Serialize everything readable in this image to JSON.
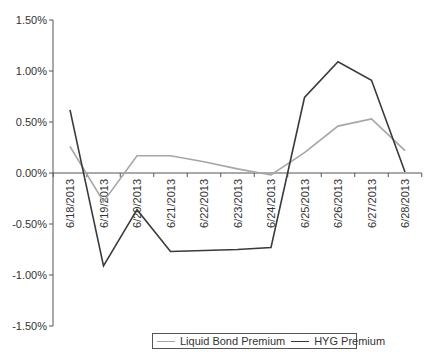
{
  "chart_data": {
    "type": "line",
    "title": "",
    "xlabel": "",
    "ylabel": "",
    "categories": [
      "6/18/2013",
      "6/19/2013",
      "6/20/2013",
      "6/21/2013",
      "6/22/2013",
      "6/23/2013",
      "6/24/2013",
      "6/25/2013",
      "6/26/2013",
      "6/27/2013",
      "6/28/2013"
    ],
    "series": [
      {
        "name": "Liquid Bond Premium",
        "color": "#a6a6a6",
        "values": [
          0.26,
          -0.28,
          0.17,
          0.17,
          0.11,
          0.04,
          -0.02,
          0.2,
          0.46,
          0.53,
          0.22
        ]
      },
      {
        "name": "HYG Premium",
        "color": "#3a3a3a",
        "values": [
          0.62,
          -0.91,
          -0.36,
          -0.77,
          -0.76,
          -0.75,
          -0.73,
          0.74,
          1.09,
          0.91,
          0.01
        ]
      }
    ],
    "ylim": [
      -1.5,
      1.5
    ],
    "yticks": [
      "1.50%",
      "1.00%",
      "0.50%",
      "0.00%",
      "-0.50%",
      "-1.00%",
      "-1.50%"
    ],
    "ytick_values": [
      1.5,
      1.0,
      0.5,
      0.0,
      -0.5,
      -1.0,
      -1.5
    ],
    "grid": false,
    "legend_position": "bottom"
  },
  "legend": {
    "items": [
      {
        "label": "Liquid Bond Premium",
        "color": "#a6a6a6"
      },
      {
        "label": "HYG Premium",
        "color": "#3a3a3a"
      }
    ]
  }
}
